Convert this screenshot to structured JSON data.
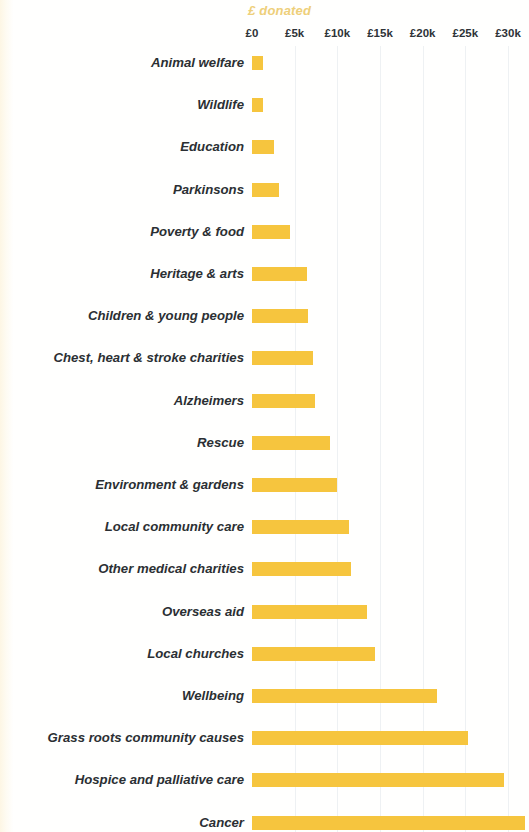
{
  "chart_data": {
    "type": "bar",
    "orientation": "horizontal",
    "title": "£ donated",
    "xlabel": "£ donated",
    "ylabel": "",
    "xlim": [
      0,
      30000
    ],
    "grid": true,
    "legend": false,
    "bar_color": "#f6c53e",
    "title_color": "#eecf7a",
    "label_color": "#2b2f33",
    "gridline_color": "#eef1f3",
    "tick_labels": [
      "£0",
      "£5k",
      "£10k",
      "£15k",
      "£20k",
      "£25k",
      "£30k"
    ],
    "tick_values": [
      0,
      5000,
      10000,
      15000,
      20000,
      25000,
      30000
    ],
    "categories": [
      "Animal welfare",
      "Wildlife",
      "Education",
      "Parkinsons",
      "Poverty & food",
      "Heritage & arts",
      "Children & young people",
      "Chest, heart & stroke charities",
      "Alzheimers",
      "Rescue",
      "Environment & gardens",
      "Local community care",
      "Other medical charities",
      "Overseas aid",
      "Local churches",
      "Wellbeing",
      "Grass roots community causes",
      "Hospice and palliative care",
      "Cancer"
    ],
    "values": [
      1300,
      1300,
      2600,
      3200,
      4500,
      6400,
      6600,
      7200,
      7400,
      9100,
      10000,
      11400,
      11600,
      13500,
      14400,
      21700,
      25300,
      29500,
      32000
    ]
  }
}
